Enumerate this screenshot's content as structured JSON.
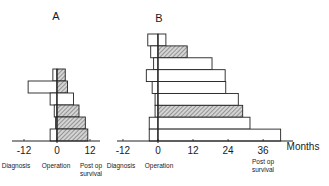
{
  "chart_data": [
    {
      "type": "bar",
      "orientation": "horizontal-floating",
      "title": "A",
      "xlabel": "Months",
      "tick_labels": [
        "-12",
        "0",
        "12"
      ],
      "ticks": [
        -12,
        0,
        12
      ],
      "xlim": [
        -13,
        14
      ],
      "annotations": [
        "Diagnosis",
        "Operation",
        "Post op survival"
      ],
      "legend": {
        "hatched": "hatched bar",
        "open": "open bar"
      },
      "bars": [
        {
          "diagnosis": -1.5,
          "survival": 3,
          "hatched": true
        },
        {
          "diagnosis": -10.5,
          "survival": 3.8,
          "hatched": true
        },
        {
          "diagnosis": -2.5,
          "survival": 6,
          "hatched": false
        },
        {
          "diagnosis": -1,
          "survival": 8,
          "hatched": true
        },
        {
          "diagnosis": -0.5,
          "survival": 10.3,
          "hatched": true
        },
        {
          "diagnosis": -2.5,
          "survival": 11.2,
          "hatched": true
        }
      ]
    },
    {
      "type": "bar",
      "orientation": "horizontal-floating",
      "title": "B",
      "xlabel": "Months",
      "tick_labels": [
        "-12",
        "0",
        "12",
        "24",
        "36"
      ],
      "ticks": [
        -12,
        0,
        12,
        24,
        36
      ],
      "xlim": [
        -13,
        46
      ],
      "annotations": [
        "Diagnosis",
        "Operation",
        "Post op survival"
      ],
      "bars": [
        {
          "diagnosis": -3.5,
          "survival": 2.7,
          "hatched": false
        },
        {
          "diagnosis": -2.5,
          "survival": 10,
          "hatched": true
        },
        {
          "diagnosis": -1.5,
          "survival": 18.5,
          "hatched": false
        },
        {
          "diagnosis": -4,
          "survival": 23,
          "hatched": false
        },
        {
          "diagnosis": -2,
          "survival": 23.2,
          "hatched": false
        },
        {
          "diagnosis": -1,
          "survival": 27.5,
          "hatched": false
        },
        {
          "diagnosis": -1,
          "survival": 29,
          "hatched": true
        },
        {
          "diagnosis": -3,
          "survival": 31.5,
          "hatched": false
        },
        {
          "diagnosis": -3,
          "survival": 42,
          "hatched": false
        }
      ]
    }
  ],
  "labels": {
    "panel_a": "A",
    "panel_b": "B",
    "months": "Months",
    "diagnosis": "Diagnosis",
    "operation": "Operation",
    "postop_line1": "Post op",
    "postop_line2": "survival"
  }
}
